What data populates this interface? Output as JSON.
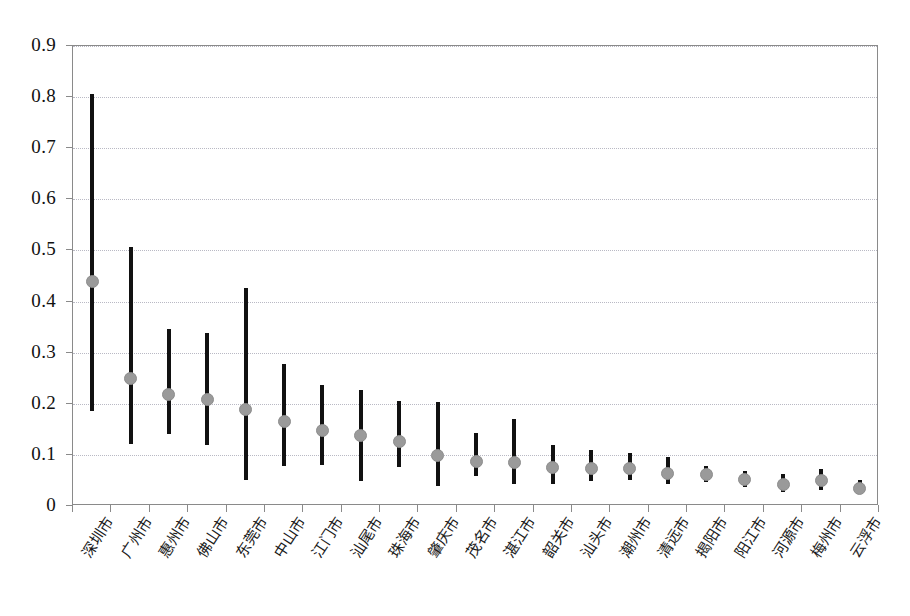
{
  "chart_data": {
    "type": "scatter",
    "title": "",
    "xlabel": "",
    "ylabel": "",
    "ylim": [
      0,
      0.9
    ],
    "ytick_step": 0.1,
    "yticks": [
      "0",
      "0.1",
      "0.2",
      "0.3",
      "0.4",
      "0.5",
      "0.6",
      "0.7",
      "0.8",
      "0.9"
    ],
    "grid": true,
    "legend": "none",
    "marker_color": "#9a9a9a",
    "bar_color": "#111111",
    "categories": [
      "深圳市",
      "广州市",
      "惠州市",
      "佛山市",
      "东莞市",
      "中山市",
      "江门市",
      "汕尾市",
      "珠海市",
      "肇庆市",
      "茂名市",
      "湛江市",
      "韶关市",
      "汕头市",
      "潮州市",
      "清远市",
      "揭阳市",
      "阳江市",
      "河源市",
      "梅州市",
      "云浮市"
    ],
    "values": [
      0.44,
      0.249,
      0.219,
      0.208,
      0.189,
      0.166,
      0.148,
      0.137,
      0.126,
      0.098,
      0.088,
      0.085,
      0.075,
      0.073,
      0.073,
      0.064,
      0.062,
      0.052,
      0.043,
      0.05,
      0.035
    ],
    "upper": [
      0.806,
      0.506,
      0.346,
      0.338,
      0.427,
      0.278,
      0.236,
      0.227,
      0.205,
      0.204,
      0.142,
      0.17,
      0.12,
      0.11,
      0.104,
      0.095,
      0.078,
      0.068,
      0.063,
      0.072,
      0.05
    ],
    "lower": [
      0.185,
      0.122,
      0.141,
      0.12,
      0.051,
      0.079,
      0.081,
      0.049,
      0.076,
      0.04,
      0.058,
      0.044,
      0.043,
      0.049,
      0.05,
      0.043,
      0.046,
      0.038,
      0.028,
      0.032,
      0.027
    ]
  }
}
